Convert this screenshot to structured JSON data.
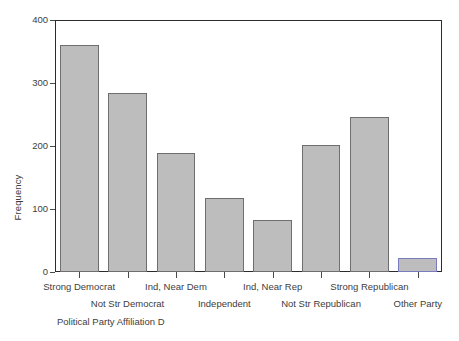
{
  "chart_data": {
    "type": "bar",
    "title": "",
    "xlabel": "Political Party Affiliation D",
    "ylabel": "Frequency",
    "categories": [
      "Strong Democrat",
      "Not Str Democrat",
      "Ind, Near Dem",
      "Independent",
      "Ind, Near Rep",
      "Not Str Republican",
      "Strong Republican",
      "Other Party"
    ],
    "values": [
      360,
      284,
      189,
      117,
      83,
      202,
      246,
      22
    ],
    "ylim": [
      0,
      400
    ],
    "yticks": [
      0,
      100,
      200,
      300,
      400
    ],
    "ytick_labels": [
      "0",
      "100",
      "200",
      "300",
      "400"
    ],
    "grid": false,
    "legend": "none",
    "bar_fill_color": "#bdbdbd",
    "bar_edge_color": "#6e6e6e",
    "accent_bar_edge_color": "#7b7bbf",
    "accent_bar_index": 7,
    "frame_color": "#2c2c2c",
    "label_rows": [
      0,
      1,
      0,
      1,
      0,
      1,
      0,
      1
    ]
  }
}
